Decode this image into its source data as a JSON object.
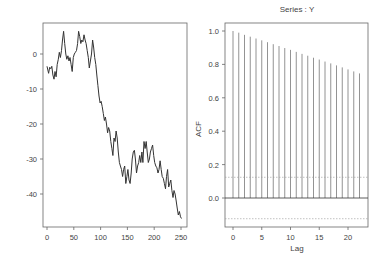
{
  "chart_data": [
    {
      "type": "line",
      "title": "",
      "xlabel": "",
      "ylabel": "",
      "xlim": [
        -3,
        255
      ],
      "ylim": [
        -48.5,
        9
      ],
      "xticks": [
        0,
        50,
        100,
        150,
        200,
        250
      ],
      "yticks": [
        0,
        -10,
        -20,
        -30,
        -40
      ],
      "grid": false,
      "series": [
        {
          "name": "Y",
          "x": [
            0,
            3,
            5,
            7,
            9,
            11,
            13,
            15,
            17,
            19,
            21,
            23,
            25,
            27,
            29,
            31,
            33,
            35,
            37,
            39,
            41,
            43,
            45,
            47,
            49,
            51,
            53,
            55,
            57,
            59,
            61,
            63,
            65,
            67,
            69,
            71,
            73,
            75,
            77,
            79,
            81,
            83,
            85,
            87,
            89,
            91,
            93,
            95,
            97,
            99,
            101,
            103,
            105,
            107,
            109,
            111,
            113,
            115,
            117,
            119,
            121,
            123,
            125,
            127,
            129,
            131,
            133,
            135,
            137,
            139,
            141,
            143,
            145,
            147,
            149,
            151,
            153,
            155,
            157,
            159,
            161,
            163,
            165,
            167,
            169,
            171,
            173,
            175,
            177,
            179,
            181,
            183,
            185,
            187,
            189,
            191,
            193,
            195,
            197,
            199,
            201,
            203,
            205,
            207,
            209,
            211,
            213,
            215,
            217,
            219,
            221,
            223,
            225,
            227,
            229,
            231,
            233,
            235,
            237,
            239,
            241,
            243,
            245,
            247,
            249,
            251
          ],
          "y": [
            -3.5,
            -5.5,
            -3.8,
            -4.2,
            -3.5,
            -6,
            -7.2,
            -5,
            -6.5,
            -3,
            -1.5,
            0.5,
            -1,
            1,
            4,
            6.5,
            3,
            0,
            -1.5,
            -0.5,
            -2,
            -1,
            -3,
            -5,
            -1,
            0,
            0.5,
            1,
            3,
            6.5,
            5,
            3,
            4,
            3.5,
            5.5,
            4,
            3,
            1,
            -1,
            -4,
            -2,
            0,
            4,
            2,
            -1,
            -3,
            -6,
            -9,
            -12,
            -14,
            -13.5,
            -15,
            -17,
            -19,
            -18,
            -20,
            -22.5,
            -21,
            -22,
            -25,
            -27,
            -29,
            -24,
            -25,
            -22,
            -24,
            -28,
            -31,
            -32,
            -33,
            -35,
            -33,
            -32,
            -37,
            -35,
            -33,
            -36,
            -37,
            -34,
            -30,
            -28,
            -27.5,
            -30,
            -34,
            -32,
            -31,
            -29,
            -31,
            -28,
            -31,
            -25,
            -27,
            -25,
            -28,
            -31,
            -30,
            -28,
            -27,
            -26,
            -29,
            -31,
            -32,
            -32.5,
            -34,
            -33,
            -30.5,
            -33,
            -35,
            -35.5,
            -37,
            -38.5,
            -35,
            -33,
            -38,
            -37,
            -36,
            -39,
            -41,
            -39,
            -40,
            -42,
            -44,
            -46,
            -45,
            -46.5,
            -47,
            -44,
            -40,
            -39,
            -36.5
          ]
        }
      ]
    },
    {
      "type": "bar",
      "title": "Series : Y",
      "xlabel": "Lag",
      "ylabel": "ACF",
      "xlim": [
        -1.3,
        23.3
      ],
      "ylim": [
        -0.17,
        1.05
      ],
      "xticks": [
        0,
        5,
        10,
        15,
        20
      ],
      "yticks": [
        0.0,
        0.2,
        0.4,
        0.6,
        0.8,
        1.0
      ],
      "grid": false,
      "categories": [
        0,
        1,
        2,
        3,
        4,
        5,
        6,
        7,
        8,
        9,
        10,
        11,
        12,
        13,
        14,
        15,
        16,
        17,
        18,
        19,
        20,
        21,
        22
      ],
      "values": [
        1.0,
        0.99,
        0.977,
        0.966,
        0.955,
        0.944,
        0.933,
        0.921,
        0.91,
        0.898,
        0.887,
        0.875,
        0.863,
        0.852,
        0.84,
        0.829,
        0.817,
        0.806,
        0.794,
        0.782,
        0.77,
        0.758,
        0.746
      ],
      "confidence_band": [
        0.124,
        -0.124
      ],
      "zero_line": 0.0
    }
  ],
  "colors": {
    "axis": "#555555",
    "series_line": "#333333",
    "acf_bars": "#777777",
    "ci_line": "#999999",
    "tick_text": "#444444"
  }
}
